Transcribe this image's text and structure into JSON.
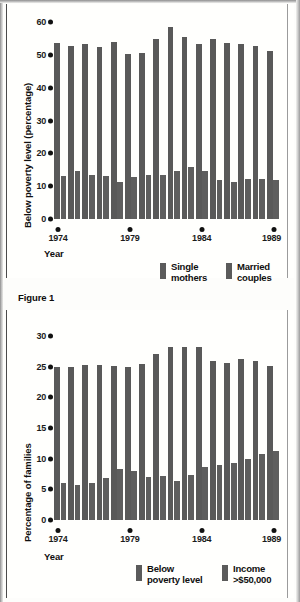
{
  "figure": {
    "caption": "Figure 1"
  },
  "charts": [
    {
      "id": "poverty-by-family-type",
      "ylabel": "Below poverty level (percentage)",
      "xlabel": "Year",
      "legend": [
        {
          "name": "single-mothers",
          "label": "Single\nmothers",
          "color": "#5b5b5b"
        },
        {
          "name": "married-couples",
          "label": "Married\ncouples",
          "color": "#5b5b5b"
        }
      ],
      "chart_data": {
        "type": "bar",
        "title": "",
        "xlabel": "Year",
        "ylabel": "Below poverty level (percentage)",
        "categories": [
          "1974",
          "1975",
          "1976",
          "1977",
          "1978",
          "1979",
          "1980",
          "1981",
          "1982",
          "1983",
          "1984",
          "1985",
          "1986",
          "1987",
          "1988",
          "1989"
        ],
        "xticklabels": [
          "1974",
          "1979",
          "1984",
          "1989"
        ],
        "yticklabels": [
          "0",
          "10",
          "20",
          "30",
          "40",
          "50",
          "60"
        ],
        "yticks": [
          0,
          10,
          20,
          30,
          40,
          50,
          60
        ],
        "ylim": [
          0,
          62
        ],
        "grid": false,
        "legend_position": "below-right",
        "series": [
          {
            "name": "Single mothers",
            "values": [
              55.4,
              54.6,
              55.0,
              54.2,
              55.7,
              51.9,
              52.3,
              56.6,
              60.3,
              57.4,
              55.0,
              56.5,
              55.5,
              55.2,
              54.5,
              52.8
            ]
          },
          {
            "name": "Married couples",
            "values": [
              13.4,
              15.2,
              13.7,
              13.5,
              11.6,
              13.1,
              13.8,
              13.9,
              15.1,
              16.3,
              15.2,
              12.4,
              11.6,
              12.6,
              12.5,
              12.4
            ]
          }
        ]
      }
    },
    {
      "id": "families-poverty-and-high-income",
      "ylabel": "Percentage of families",
      "xlabel": "Year",
      "legend": [
        {
          "name": "below-poverty-level",
          "label": "Below\npoverty level",
          "color": "#5b5b5b"
        },
        {
          "name": "income-over-50000",
          "label": "Income\n>$50,000",
          "color": "#5b5b5b"
        }
      ],
      "chart_data": {
        "type": "bar",
        "title": "",
        "xlabel": "Year",
        "ylabel": "Percentage of families",
        "categories": [
          "1974",
          "1975",
          "1976",
          "1977",
          "1978",
          "1979",
          "1980",
          "1981",
          "1982",
          "1983",
          "1984",
          "1985",
          "1986",
          "1987",
          "1988",
          "1989"
        ],
        "xticklabels": [
          "1974",
          "1979",
          "1984",
          "1989"
        ],
        "yticklabels": [
          "0",
          "5",
          "10",
          "15",
          "20",
          "25",
          "30"
        ],
        "yticks": [
          0,
          5,
          10,
          15,
          20,
          25,
          30
        ],
        "ylim": [
          0,
          31
        ],
        "grid": false,
        "legend_position": "below-right",
        "series": [
          {
            "name": "Below poverty level",
            "values": [
              25.7,
              25.7,
              26.1,
              26.1,
              25.9,
              25.8,
              26.3,
              27.9,
              29.2,
              29.2,
              29.1,
              26.8,
              26.5,
              27.2,
              26.8,
              25.9
            ]
          },
          {
            "name": "Income >$50,000",
            "values": [
              6.2,
              5.9,
              6.3,
              7.0,
              8.6,
              8.2,
              7.3,
              7.4,
              6.6,
              7.6,
              9.0,
              9.3,
              9.6,
              10.2,
              11.2,
              11.7
            ]
          }
        ]
      }
    }
  ]
}
